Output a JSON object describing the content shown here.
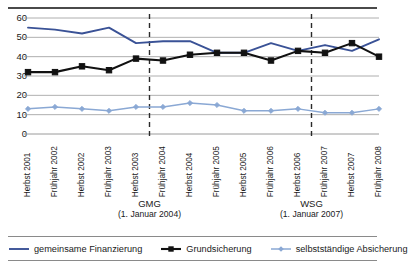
{
  "chart_data": {
    "type": "line",
    "title": "",
    "xlabel": "",
    "ylabel": "",
    "ylim": [
      0,
      60
    ],
    "yticks": [
      0,
      10,
      20,
      30,
      40,
      50,
      60
    ],
    "grid": true,
    "legend_position": "bottom",
    "categories": [
      "Herbst 2001",
      "Frühjahr 2002",
      "Herbst 2002",
      "Frühjahr 2003",
      "Herbst 2003",
      "Frühjahr 2004",
      "Herbst 2004",
      "Frühjahr 2005",
      "Herbst 2005",
      "Frühjahr 2006",
      "Herbst 2006",
      "Frühjahr 2007",
      "Herbst 2007",
      "Frühjahr 2008"
    ],
    "series": [
      {
        "name": "gemeinsame Finanzierung",
        "color": "#3a5296",
        "marker": "none",
        "values": [
          55,
          54,
          52,
          55,
          47,
          48,
          48,
          42,
          42,
          47,
          43,
          46,
          43,
          49
        ]
      },
      {
        "name": "Grundsicherung",
        "color": "#111111",
        "marker": "square",
        "values": [
          32,
          32,
          35,
          33,
          39,
          38,
          41,
          42,
          42,
          38,
          43,
          42,
          47,
          40
        ]
      },
      {
        "name": "selbstständige Absicherung",
        "color": "#8aa8d4",
        "marker": "diamond",
        "values": [
          13,
          14,
          13,
          12,
          14,
          14,
          16,
          15,
          12,
          12,
          13,
          11,
          11,
          13
        ]
      }
    ],
    "annotations": [
      {
        "label": "GMG",
        "date": "(1. Januar 2004)",
        "at_category_index": 4.5
      },
      {
        "label": "WSG",
        "date": "(1. Januar 2007)",
        "at_category_index": 10.5
      }
    ]
  },
  "legend": {
    "items": [
      {
        "label": "gemeinsame Finanzierung"
      },
      {
        "label": "Grundsicherung"
      },
      {
        "label": "selbstständige Absicherung"
      }
    ]
  }
}
